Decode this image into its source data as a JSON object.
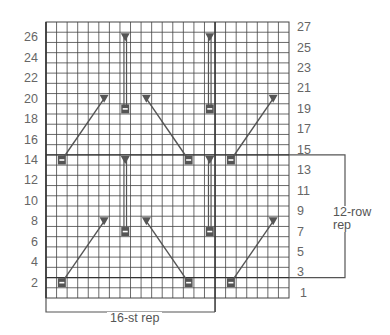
{
  "chart": {
    "columns": 23,
    "rows": 27,
    "grid": {
      "left": 46,
      "top": 22,
      "right": 289,
      "bottom": 298
    },
    "colors": {
      "grid": "#444444",
      "symbol": "#555555",
      "line": "#555555",
      "label": "#666666"
    },
    "left_row_labels": [
      "2",
      "4",
      "6",
      "8",
      "10",
      "12",
      "14",
      "16",
      "18",
      "20",
      "22",
      "24",
      "26"
    ],
    "right_row_labels": [
      "1",
      "3",
      "5",
      "7",
      "9",
      "11",
      "13",
      "15",
      "17",
      "19",
      "21",
      "23",
      "25",
      "27"
    ],
    "stitch_repeat": {
      "label": "16-st rep",
      "columns": 16
    },
    "row_repeat": {
      "label_line1": "12-row",
      "label_line2": "rep",
      "from_row": 3,
      "to_row": 14
    },
    "symbols": {
      "purl_boxes": [
        {
          "row": 2,
          "col": 1
        },
        {
          "row": 2,
          "col": 13
        },
        {
          "row": 2,
          "col": 17
        },
        {
          "row": 7,
          "col": 7
        },
        {
          "row": 7,
          "col": 15
        },
        {
          "row": 14,
          "col": 1
        },
        {
          "row": 14,
          "col": 13
        },
        {
          "row": 14,
          "col": 17
        },
        {
          "row": 19,
          "col": 7
        },
        {
          "row": 19,
          "col": 15
        }
      ],
      "triangles": [
        {
          "row": 8,
          "col": 5
        },
        {
          "row": 8,
          "col": 9
        },
        {
          "row": 8,
          "col": 21
        },
        {
          "row": 14,
          "col": 7
        },
        {
          "row": 14,
          "col": 15
        },
        {
          "row": 20,
          "col": 5
        },
        {
          "row": 20,
          "col": 9
        },
        {
          "row": 20,
          "col": 21
        },
        {
          "row": 26,
          "col": 7
        },
        {
          "row": 26,
          "col": 15
        }
      ],
      "connectors": [
        {
          "from": {
            "row": 2,
            "col": 1
          },
          "to": {
            "row": 8,
            "col": 5
          }
        },
        {
          "from": {
            "row": 2,
            "col": 13
          },
          "to": {
            "row": 8,
            "col": 9
          }
        },
        {
          "from": {
            "row": 2,
            "col": 17
          },
          "to": {
            "row": 8,
            "col": 21
          }
        },
        {
          "from": {
            "row": 7,
            "col": 7
          },
          "to": {
            "row": 14,
            "col": 7
          }
        },
        {
          "from": {
            "row": 7,
            "col": 15
          },
          "to": {
            "row": 14,
            "col": 15
          }
        },
        {
          "from": {
            "row": 14,
            "col": 1
          },
          "to": {
            "row": 20,
            "col": 5
          }
        },
        {
          "from": {
            "row": 14,
            "col": 13
          },
          "to": {
            "row": 20,
            "col": 9
          }
        },
        {
          "from": {
            "row": 14,
            "col": 17
          },
          "to": {
            "row": 20,
            "col": 21
          }
        },
        {
          "from": {
            "row": 19,
            "col": 7
          },
          "to": {
            "row": 26,
            "col": 7
          }
        },
        {
          "from": {
            "row": 19,
            "col": 15
          },
          "to": {
            "row": 26,
            "col": 15
          }
        }
      ]
    }
  }
}
